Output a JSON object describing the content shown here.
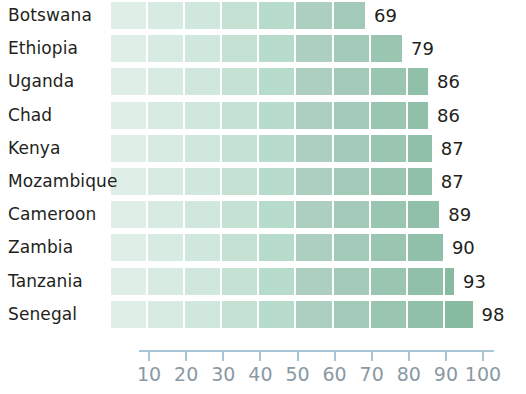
{
  "chart_data": {
    "type": "bar",
    "orientation": "horizontal",
    "title": "",
    "subtitle": "",
    "xlabel": "",
    "ylabel": "",
    "categories": [
      "Botswana",
      "Ethiopia",
      "Uganda",
      "Chad",
      "Kenya",
      "Mozambique",
      "Cameroon",
      "Zambia",
      "Tanzania",
      "Senegal"
    ],
    "values": [
      69,
      79,
      86,
      86,
      87,
      87,
      89,
      90,
      93,
      98
    ],
    "value_labels": [
      "69",
      "79",
      "86",
      "86",
      "87",
      "87",
      "89",
      "90",
      "93",
      "98"
    ],
    "xlim": [
      0,
      100
    ],
    "xticks": [
      10,
      20,
      30,
      40,
      50,
      60,
      70,
      80,
      90,
      100
    ],
    "xtick_labels": [
      "10",
      "20",
      "30",
      "40",
      "50",
      "60",
      "70",
      "80",
      "90",
      "100"
    ],
    "grid": false,
    "legend": null,
    "segment_size": 10,
    "bar_fill_palette": [
      "#e0eee8",
      "#d8ebe2",
      "#cfe7dc",
      "#c4e1d4",
      "#b8dccc",
      "#accfc0",
      "#a3cab8",
      "#99c5b1",
      "#90c0a9",
      "#86bba2"
    ],
    "axis_color": "#a9c6d8",
    "axis_label_color": "#8a99a3",
    "text_color": "#231f20",
    "background": "#ffffff"
  },
  "axis": {
    "ticks": [
      {
        "value": 10,
        "label": "10"
      },
      {
        "value": 20,
        "label": "20"
      },
      {
        "value": 30,
        "label": "30"
      },
      {
        "value": 40,
        "label": "40"
      },
      {
        "value": 50,
        "label": "50"
      },
      {
        "value": 60,
        "label": "60"
      },
      {
        "value": 70,
        "label": "70"
      },
      {
        "value": 80,
        "label": "80"
      },
      {
        "value": 90,
        "label": "90"
      },
      {
        "value": 100,
        "label": "100"
      }
    ]
  },
  "rows": [
    {
      "label": "Botswana",
      "value": 69,
      "value_label": "69"
    },
    {
      "label": "Ethiopia",
      "value": 79,
      "value_label": "79"
    },
    {
      "label": "Uganda",
      "value": 86,
      "value_label": "86"
    },
    {
      "label": "Chad",
      "value": 86,
      "value_label": "86"
    },
    {
      "label": "Kenya",
      "value": 87,
      "value_label": "87"
    },
    {
      "label": "Mozambique",
      "value": 87,
      "value_label": "87"
    },
    {
      "label": "Cameroon",
      "value": 89,
      "value_label": "89"
    },
    {
      "label": "Zambia",
      "value": 90,
      "value_label": "90"
    },
    {
      "label": "Tanzania",
      "value": 93,
      "value_label": "93"
    },
    {
      "label": "Senegal",
      "value": 98,
      "value_label": "98"
    }
  ]
}
